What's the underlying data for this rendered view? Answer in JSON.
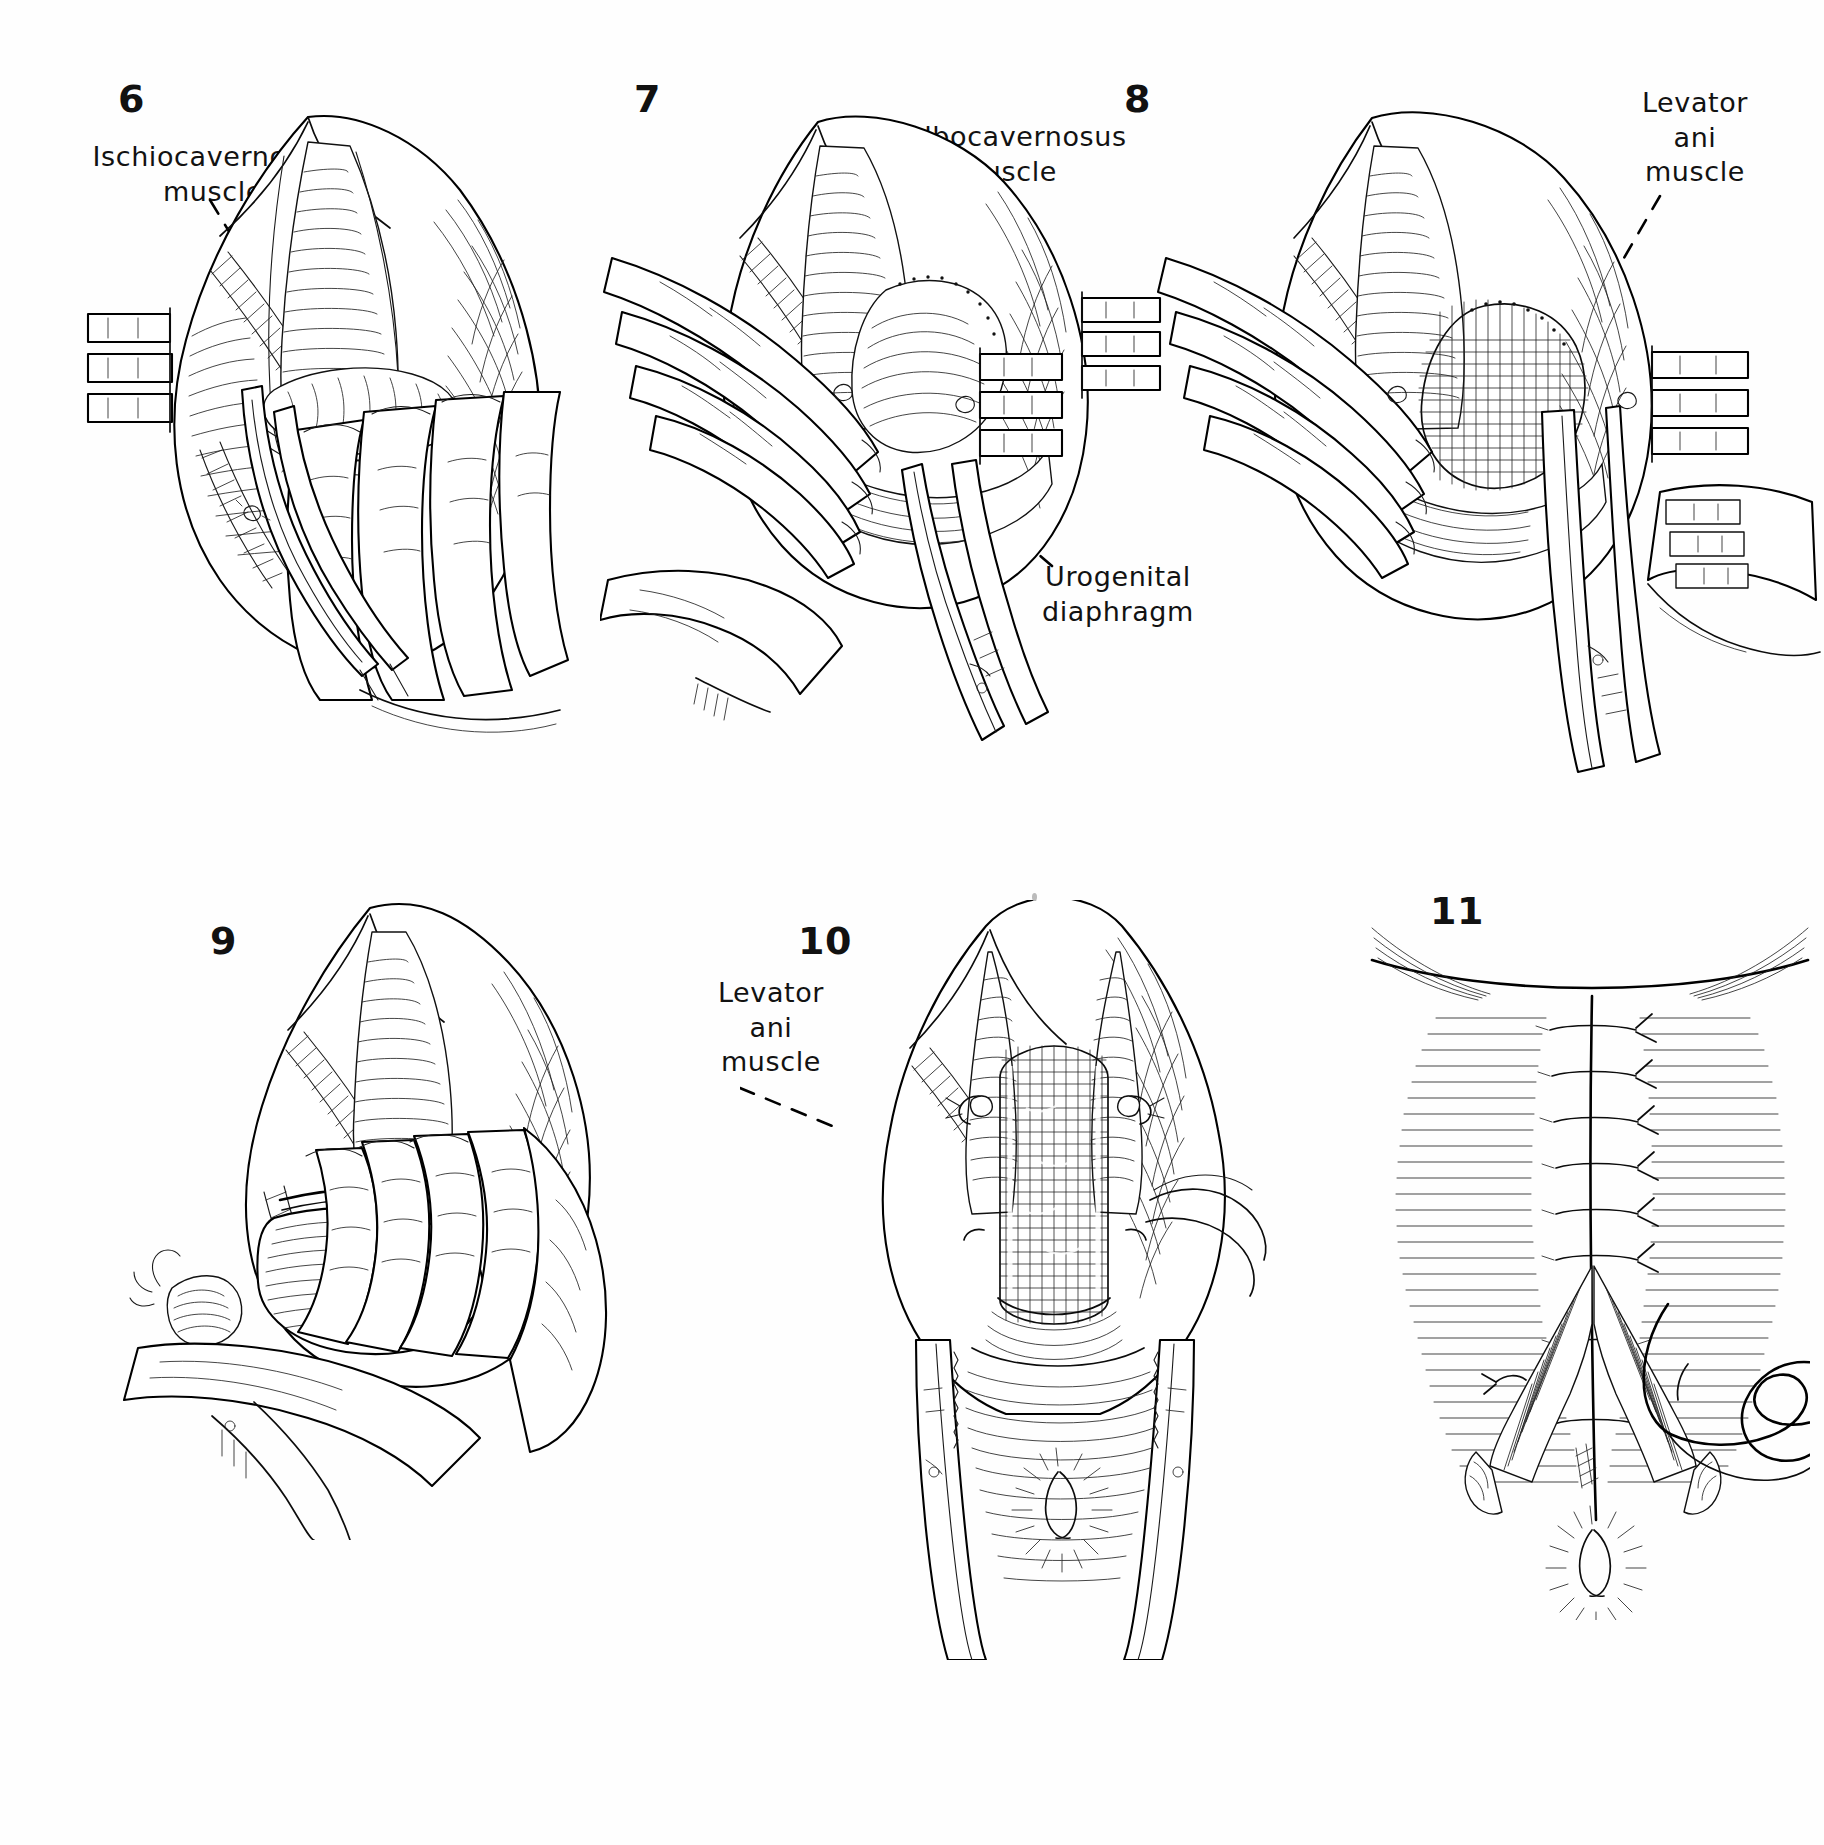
{
  "plate": {
    "title": "Perineal dissection operative sequence plate",
    "background_color": "#ffffff",
    "ink_color": "#111111",
    "panel_count": 6
  },
  "panels": [
    {
      "id": "panel-6",
      "number": "6",
      "row": "top",
      "column": "left",
      "subject": "Ischiocavernosus muscle exposed; fingers retract tissue, scissors in field",
      "labels": [
        {
          "name": "ischiocavernosus-muscle",
          "text": "Ischiocavernosus\nmuscle",
          "lines": [
            "Ischiocavernosus",
            "muscle"
          ],
          "align": "center",
          "leader": "dashed"
        }
      ],
      "instruments": [
        "retractor-blades",
        "scissors",
        "fingers"
      ]
    },
    {
      "id": "panel-7",
      "number": "7",
      "row": "top",
      "column": "center",
      "subject": "Bulbocavernosus muscle and urogenital diaphragm with clamp and retracting fingers",
      "labels": [
        {
          "name": "bulbocavernosus-muscle",
          "text": "Bulbocavernosus\nmuscle",
          "lines": [
            "Bulbocavernosus",
            "muscle"
          ],
          "align": "center",
          "leader": "dashed"
        },
        {
          "name": "urogenital-diaphragm",
          "text": "Urogenital\ndiaphragm",
          "lines": [
            "Urogenital",
            "diaphragm"
          ],
          "align": "center",
          "leader": "dashed"
        }
      ],
      "instruments": [
        "retractor-blades",
        "hemostat-clamp",
        "fingers"
      ]
    },
    {
      "id": "panel-8",
      "number": "8",
      "row": "top",
      "column": "right",
      "subject": "Levator ani muscle exposed, clamp and retractors in place",
      "labels": [
        {
          "name": "levator-ani-muscle",
          "text": "Levator\nani\nmuscle",
          "lines": [
            "Levator",
            "ani",
            "muscle"
          ],
          "align": "center",
          "leader": "dashed"
        }
      ],
      "instruments": [
        "retractor-blades",
        "hemostat-clamp",
        "fingers"
      ]
    },
    {
      "id": "panel-9",
      "number": "9",
      "row": "bottom",
      "column": "left",
      "subject": "Blunt finger dissection of the specimen over a retractor blade",
      "labels": [],
      "instruments": [
        "retractor-blade",
        "hand"
      ]
    },
    {
      "id": "panel-10",
      "number": "10",
      "row": "bottom",
      "column": "center",
      "subject": "Completed cavity after removal; levator ani muscle bordering the defect, sutures placed",
      "labels": [
        {
          "name": "levator-ani-muscle",
          "text": "Levator\nani\nmuscle",
          "lines": [
            "Levator",
            "ani",
            "muscle"
          ],
          "align": "center",
          "leader": "dashed"
        }
      ],
      "instruments": [
        "retractor-blades",
        "suture-threads"
      ]
    },
    {
      "id": "panel-11",
      "number": "11",
      "row": "bottom",
      "column": "right",
      "subject": "Midline perineal incision closed with interrupted sutures; curved needle and suture tail at right",
      "labels": [],
      "instruments": [
        "curved-needle",
        "suture-thread"
      ],
      "suture_count": 7
    }
  ],
  "icons": {
    "dashed_leader": "dashed-leader-line",
    "retractor": "retractor-blade-icon",
    "clamp": "hemostat-clamp-icon",
    "needle": "curved-needle-icon"
  }
}
